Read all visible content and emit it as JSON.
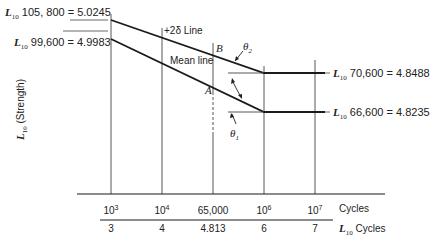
{
  "diagram": {
    "type": "fatigue-strength L10 vs log cycles (S-N) diagram",
    "y_axis_label": {
      "symbol": "L",
      "subscript": "10",
      "text": "(Strength)"
    },
    "left_labels": [
      {
        "symbol": "L",
        "subscript": "10",
        "value_text": "105, 800 = 5.0245"
      },
      {
        "symbol": "L",
        "subscript": "10",
        "value_text": "99,600 = 4.9983"
      }
    ],
    "right_labels": [
      {
        "symbol": "L",
        "subscript": "10",
        "value_text": "70,600 = 4.8488"
      },
      {
        "symbol": "L",
        "subscript": "10",
        "value_text": "66,600 = 4.8235"
      }
    ],
    "line_labels": {
      "upper": "+2δ Line",
      "mean": "Mean line"
    },
    "points": {
      "B": "B",
      "A": "A"
    },
    "angles": {
      "theta2": "θ",
      "theta2_sub": "2",
      "theta1": "θ",
      "theta1_sub": "1"
    },
    "x_axis_cycles": {
      "ticks": [
        {
          "base": "10",
          "exp": "3"
        },
        {
          "base": "10",
          "exp": "4"
        },
        {
          "base": "65,000",
          "exp": ""
        },
        {
          "base": "10",
          "exp": "6"
        },
        {
          "base": "10",
          "exp": "7"
        }
      ],
      "unit_label": "Cycles"
    },
    "x_axis_log": {
      "ticks": [
        "3",
        "4",
        "4.813",
        "6",
        "7"
      ],
      "unit_symbol": "L",
      "unit_subscript": "10",
      "unit_label": "Cycles"
    },
    "colors": {
      "line": "#1a1a1a",
      "grid": "#444444",
      "background": "#ffffff"
    }
  }
}
